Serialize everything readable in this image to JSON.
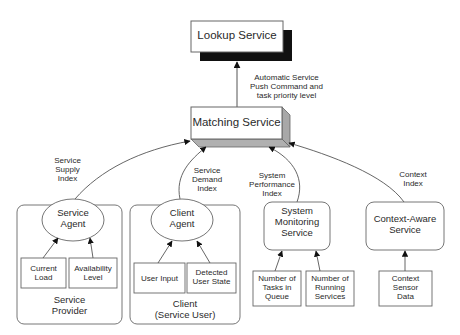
{
  "lookup_service": {
    "label": "Lookup Service"
  },
  "push_label": {
    "line1": "Automatic Service",
    "line2": "Push Command and",
    "line3": "task priority level"
  },
  "matching_service": {
    "label": "Matching Service"
  },
  "edges": {
    "supply": {
      "line1": "Service",
      "line2": "Supply",
      "line3": "Index"
    },
    "demand": {
      "line1": "Service",
      "line2": "Demand",
      "line3": "Index"
    },
    "performance": {
      "line1": "System",
      "line2": "Performance",
      "line3": "Index"
    },
    "context": {
      "line1": "Context",
      "line2": "Index"
    }
  },
  "service_provider": {
    "agent": {
      "line1": "Service",
      "line2": "Agent"
    },
    "inputs": [
      {
        "line1": "Current",
        "line2": "Load"
      },
      {
        "line1": "Availability",
        "line2": "Level"
      }
    ],
    "group": {
      "line1": "Service",
      "line2": "Provider"
    }
  },
  "client": {
    "agent": {
      "line1": "Client",
      "line2": "Agent"
    },
    "inputs": [
      {
        "line1": "User Input"
      },
      {
        "line1": "Detected",
        "line2": "User State"
      }
    ],
    "group": {
      "line1": "Client",
      "line2": "(Service User)"
    }
  },
  "system_monitoring": {
    "label": {
      "line1": "System",
      "line2": "Monitoring",
      "line3": "Service"
    },
    "inputs": [
      {
        "line1": "Number of",
        "line2": "Tasks in",
        "line3": "Queue"
      },
      {
        "line1": "Number of",
        "line2": "Running",
        "line3": "Services"
      }
    ]
  },
  "context_aware": {
    "label": {
      "line1": "Context-Aware",
      "line2": "Service"
    },
    "inputs": [
      {
        "line1": "Context",
        "line2": "Sensor",
        "line3": "Data"
      }
    ]
  },
  "colors": {
    "stroke": "#555555",
    "shadow": "#111111",
    "bevel": "#b0b0b0",
    "text": "#2a2a2a"
  }
}
